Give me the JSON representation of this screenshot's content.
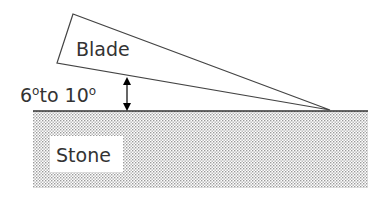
{
  "diagram": {
    "blade_label": "Blade",
    "stone_label": "Stone",
    "angle_label_start": "6",
    "angle_label_mid": "to 10",
    "degree_symbol": "o"
  }
}
